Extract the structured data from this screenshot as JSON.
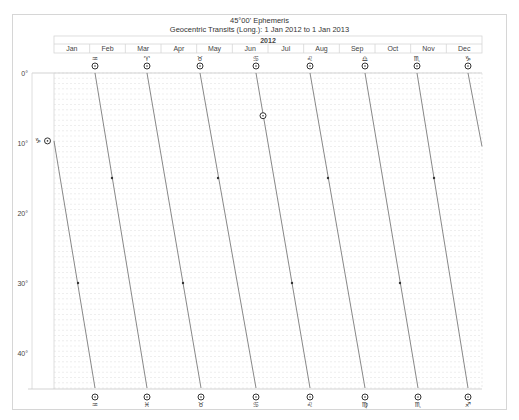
{
  "title": "45°00' Ephemeris",
  "subtitle": "Geocentric Transits (Long.): 1 Jan 2012 to 1 Jan 2013",
  "year_label": "2012",
  "months": [
    "Jan",
    "Feb",
    "Mar",
    "Apr",
    "May",
    "Jun",
    "Jul",
    "Aug",
    "Sep",
    "Oct",
    "Nov",
    "Dec"
  ],
  "y_ticks": [
    "0°",
    "10°",
    "20°",
    "30°",
    "40°"
  ],
  "colors": {
    "frame": "#d6d6d6",
    "grid": "#dcdcdc",
    "line": "#555555",
    "text": "#333333"
  },
  "top_markers": [
    {
      "x": 95,
      "glyph": "♒"
    },
    {
      "x": 147,
      "glyph": "♈"
    },
    {
      "x": 200,
      "glyph": "♉"
    },
    {
      "x": 256,
      "glyph": "♋"
    },
    {
      "x": 310,
      "glyph": "♌"
    },
    {
      "x": 365,
      "glyph": "♎"
    },
    {
      "x": 417,
      "glyph": "♏"
    },
    {
      "x": 468,
      "glyph": "♑"
    }
  ],
  "bottom_markers": [
    {
      "x": 95,
      "glyph": "♒"
    },
    {
      "x": 147,
      "glyph": "♓"
    },
    {
      "x": 201,
      "glyph": "♉"
    },
    {
      "x": 256,
      "glyph": "♋"
    },
    {
      "x": 310,
      "glyph": "♌"
    },
    {
      "x": 365,
      "glyph": "♍"
    },
    {
      "x": 418,
      "glyph": "♏"
    },
    {
      "x": 468,
      "glyph": "♐"
    }
  ],
  "left_marker": {
    "glyph": "♑",
    "y_deg": 9.7
  },
  "station_marker": {
    "x": 263,
    "y_deg": 6.1
  },
  "chart_data": {
    "type": "line",
    "title": "45°00' Ephemeris",
    "subtitle": "Geocentric Transits (Long.): 1 Jan 2012 to 1 Jan 2013",
    "xlabel": "2012 (months)",
    "ylabel": "Longitude mod 45°",
    "ylim": [
      0,
      45
    ],
    "x_categories": [
      "Jan",
      "Feb",
      "Mar",
      "Apr",
      "May",
      "Jun",
      "Jul",
      "Aug",
      "Sep",
      "Oct",
      "Nov",
      "Dec"
    ],
    "y_tick_labels": [
      "0°",
      "10°",
      "20°",
      "30°",
      "40°"
    ],
    "grid": true,
    "series": [
      {
        "name": "Sun (☉)",
        "segments": [
          {
            "from": {
              "x_px": 54,
              "deg": 9.7
            },
            "to": {
              "x_px": 95,
              "deg": 45
            }
          },
          {
            "from": {
              "x_px": 95,
              "deg": 0
            },
            "to": {
              "x_px": 147,
              "deg": 45
            }
          },
          {
            "from": {
              "x_px": 147,
              "deg": 0
            },
            "to": {
              "x_px": 201,
              "deg": 45
            }
          },
          {
            "from": {
              "x_px": 200,
              "deg": 0
            },
            "to": {
              "x_px": 256,
              "deg": 45
            }
          },
          {
            "from": {
              "x_px": 256,
              "deg": 0
            },
            "to": {
              "x_px": 310,
              "deg": 45
            }
          },
          {
            "from": {
              "x_px": 310,
              "deg": 0
            },
            "to": {
              "x_px": 365,
              "deg": 45
            }
          },
          {
            "from": {
              "x_px": 365,
              "deg": 0
            },
            "to": {
              "x_px": 418,
              "deg": 45
            }
          },
          {
            "from": {
              "x_px": 417,
              "deg": 0
            },
            "to": {
              "x_px": 468,
              "deg": 45
            }
          },
          {
            "from": {
              "x_px": 468,
              "deg": 0
            },
            "to": {
              "x_px": 482,
              "deg": 10.5
            }
          }
        ]
      }
    ]
  }
}
